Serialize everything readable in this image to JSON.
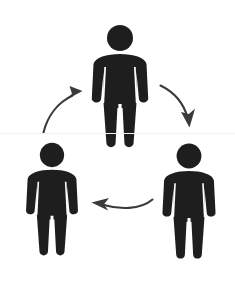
{
  "canvas": {
    "width": 235,
    "height": 289,
    "background_color": "#ffffff",
    "title": "Three-person cycle diagram"
  },
  "colors": {
    "figure_fill": "#1e1e1e",
    "arrow_stroke": "#3a3a3a",
    "background": "#ffffff",
    "scanline": "#f2f2f2"
  },
  "figures": [
    {
      "id": "figure-top",
      "position": "top-center",
      "center_x": 120,
      "head_center_y": 38,
      "head_radius": 13,
      "scale": 1.0,
      "fill": "#1e1e1e",
      "bbox": {
        "x": 92,
        "y": 26,
        "width": 56,
        "height": 122
      }
    },
    {
      "id": "figure-bottom-left",
      "position": "bottom-left",
      "center_x": 52,
      "head_center_y": 155,
      "head_radius": 12,
      "scale": 0.92,
      "fill": "#1e1e1e",
      "bbox": {
        "x": 27,
        "y": 143,
        "width": 51,
        "height": 125
      }
    },
    {
      "id": "figure-bottom-right",
      "position": "bottom-right",
      "center_x": 189,
      "head_center_y": 156,
      "head_radius": 12,
      "scale": 0.94,
      "fill": "#1e1e1e",
      "bbox": {
        "x": 163,
        "y": 144,
        "width": 52,
        "height": 124
      }
    }
  ],
  "arrows": [
    {
      "id": "arrow-top-to-right",
      "from": "figure-top",
      "to": "figure-bottom-right",
      "direction": "down-right",
      "stroke": "#3a3a3a",
      "stroke_width": 2.1
    },
    {
      "id": "arrow-right-to-left",
      "from": "figure-bottom-right",
      "to": "figure-bottom-left",
      "direction": "left",
      "stroke": "#3a3a3a",
      "stroke_width": 2.1
    },
    {
      "id": "arrow-left-to-top",
      "from": "figure-bottom-left",
      "to": "figure-top",
      "direction": "up-right",
      "stroke": "#3a3a3a",
      "stroke_width": 2.1
    }
  ],
  "artifacts": {
    "scanline_y": 133
  },
  "alt_text": "Three black stick-figure pictograms arranged in a triangle, connected by three curved arrows forming a continuous cycle."
}
